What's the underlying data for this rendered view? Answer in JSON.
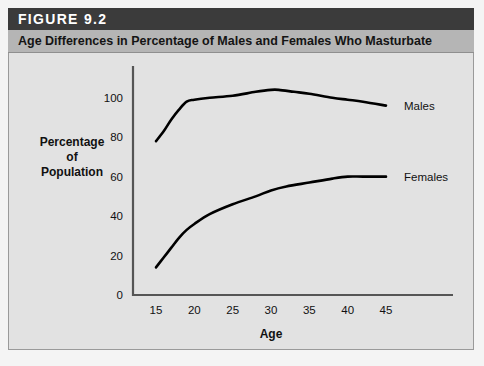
{
  "figure": {
    "number_label": "FIGURE 9.2",
    "caption": "Age Differences in Percentage of Males and Females Who Masturbate"
  },
  "colors": {
    "number_band": "#3b3b3b",
    "caption_band": "#b5b5b5",
    "plot_background": "#e2e2e2",
    "axis": "#555555",
    "curve": "#000000",
    "text": "#111111"
  },
  "chart_data": {
    "type": "line",
    "title": "Age Differences in Percentage of Males and Females Who Masturbate",
    "xlabel": "Age",
    "ylabel": "Percentage of Population",
    "ylabel_lines": [
      "Percentage",
      "of",
      "Population"
    ],
    "xlim": [
      12,
      48
    ],
    "ylim": [
      0,
      110
    ],
    "xticks": [
      15,
      20,
      25,
      30,
      35,
      40,
      45
    ],
    "xtick_labels": [
      "15",
      "20",
      "25",
      "30",
      "35",
      "40",
      "45"
    ],
    "yticks": [
      0,
      20,
      40,
      60,
      80,
      100
    ],
    "ytick_labels": [
      "0",
      "20",
      "40",
      "60",
      "80",
      "100"
    ],
    "grid": false,
    "legend_position": "inline-right",
    "series": [
      {
        "name": "Males",
        "label": "Males",
        "x": [
          15,
          16,
          17,
          18,
          19,
          20,
          22,
          25,
          28,
          30,
          31,
          33,
          35,
          38,
          40,
          42,
          45
        ],
        "values": [
          78,
          83,
          89,
          94,
          98,
          99,
          100,
          101,
          103,
          104,
          104,
          103,
          102,
          100,
          99,
          98,
          96
        ]
      },
      {
        "name": "Females",
        "label": "Females",
        "x": [
          15,
          16,
          17,
          18,
          19,
          20,
          22,
          25,
          28,
          30,
          32,
          35,
          38,
          40,
          42,
          45
        ],
        "values": [
          14,
          19,
          24,
          29,
          33,
          36,
          41,
          46,
          50,
          53,
          55,
          57,
          59,
          60,
          60,
          60
        ]
      }
    ]
  }
}
